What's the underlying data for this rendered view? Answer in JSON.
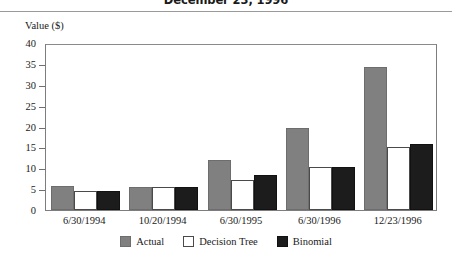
{
  "header": {
    "title": "December 23, 1996"
  },
  "chart_data": {
    "type": "bar",
    "title": "December 23, 1996",
    "xlabel": "",
    "ylabel": "Value ($)",
    "ylim": [
      0,
      40
    ],
    "ytick_step": 5,
    "ytick_labels": [
      "40",
      "35",
      "30",
      "25",
      "20",
      "15",
      "10",
      "5",
      "0"
    ],
    "grid": false,
    "legend_position": "bottom-center",
    "categories": [
      "6/30/1994",
      "10/20/1994",
      "6/30/1995",
      "6/30/1996",
      "12/23/1996"
    ],
    "series": [
      {
        "name": "Actual",
        "color": "#808080",
        "values": [
          5.7,
          5.6,
          12.0,
          19.7,
          34.3
        ]
      },
      {
        "name": "Decision Tree",
        "color": "#ffffff",
        "values": [
          4.5,
          5.5,
          7.3,
          10.3,
          15.2
        ]
      },
      {
        "name": "Binomial",
        "color": "#1c1c1c",
        "values": [
          4.6,
          5.6,
          8.5,
          10.3,
          15.7
        ]
      }
    ]
  }
}
